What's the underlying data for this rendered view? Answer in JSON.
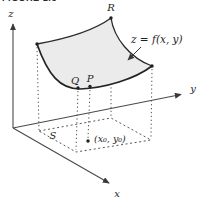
{
  "figure": {
    "caption": "FIGURE 1.5",
    "equation_label": "z = f(x, y)",
    "axes": {
      "x_label": "x",
      "y_label": "y",
      "z_label": "z"
    },
    "points": {
      "r_label": "R",
      "q_label": "Q",
      "p_label": "P",
      "base_point_label": "(x₀, y₀)"
    },
    "region": {
      "s_label": "S"
    },
    "colors": {
      "axis_line": "#4a4a4a",
      "curve_line": "#2b2b2b",
      "dotted_line": "#555555",
      "surface_fill": "#ebebeb",
      "text": "#1e1e1e",
      "background": "#ffffff"
    }
  }
}
